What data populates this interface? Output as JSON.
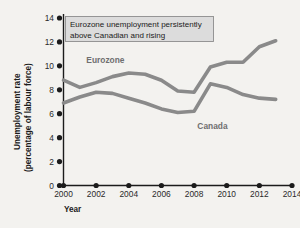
{
  "chart_data": {
    "type": "line",
    "title": "",
    "xlabel": "Year",
    "ylabel": "Unemployment rate (percentage of labour force)",
    "ylabel_line1": "Unemployment rate",
    "ylabel_line2": "(percentage of labour force)",
    "xlim": [
      2000,
      2014
    ],
    "ylim": [
      0,
      14
    ],
    "yticks": [
      0,
      2,
      4,
      6,
      8,
      10,
      12,
      14
    ],
    "xticks": [
      2000,
      2002,
      2004,
      2006,
      2008,
      2010,
      2012,
      2014
    ],
    "grid": false,
    "legend_position": "inline-labels",
    "x": [
      2000,
      2001,
      2002,
      2003,
      2004,
      2005,
      2006,
      2007,
      2008,
      2009,
      2010,
      2011,
      2012,
      2013
    ],
    "series": [
      {
        "name": "Eurozone",
        "color": "#8a8a8a",
        "values": [
          8.8,
          8.2,
          8.6,
          9.1,
          9.4,
          9.3,
          8.8,
          7.9,
          7.8,
          9.9,
          10.3,
          10.3,
          11.6,
          12.1
        ],
        "label_x": 2001.4,
        "label_y": 10.2
      },
      {
        "name": "Canada",
        "color": "#8a8a8a",
        "values": [
          6.9,
          7.4,
          7.8,
          7.7,
          7.3,
          6.9,
          6.4,
          6.1,
          6.2,
          8.5,
          8.2,
          7.6,
          7.3,
          7.2
        ],
        "label_x": 2008.2,
        "label_y": 4.7
      }
    ],
    "annotation": {
      "line1": "Eurozone unemployment persistently",
      "line2": "above Canadian and rising"
    }
  }
}
